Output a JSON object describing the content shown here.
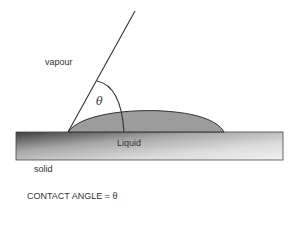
{
  "labels": {
    "vapour": "vapour",
    "theta": "θ",
    "liquid": "Liquid",
    "solid": "solid",
    "caption": "CONTACT ANGLE = θ"
  },
  "colors": {
    "line": "#333333",
    "drop_fill": "#9a9a9a",
    "solid_dark": "#4a4a4a",
    "solid_light": "#f0f0f0"
  }
}
